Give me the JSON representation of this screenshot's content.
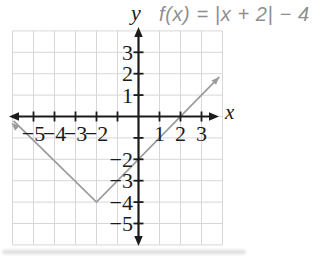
{
  "caption": {
    "y_axis_title": "y",
    "formula": "f(x) = |x + 2| − 4"
  },
  "chart_data": {
    "type": "line",
    "title": "f(x) = |x + 2| − 4",
    "function": "f(x) = |x + 2| − 4",
    "xlabel": "x",
    "ylabel": "y",
    "xlim": [
      -6,
      4
    ],
    "ylim": [
      -6,
      4
    ],
    "grid": true,
    "vertex": [
      -2,
      -4
    ],
    "x_intercepts": [
      -6,
      2
    ],
    "y_intercept": -2,
    "series": [
      {
        "name": "f(x) = |x + 2| − 4",
        "points": [
          [
            -5.95,
            -0.2
          ],
          [
            -2,
            -4
          ],
          [
            3.85,
            1.85
          ]
        ],
        "arrow_both_ends": true
      }
    ],
    "x_tick_marks": [
      -5,
      -4,
      -3,
      -2,
      -1,
      1,
      2,
      3
    ],
    "y_tick_marks": [
      -5,
      -4,
      -3,
      -2,
      -1,
      1,
      2,
      3
    ],
    "x_tick_labels": [
      {
        "v": -5,
        "label": "−5"
      },
      {
        "v": -4,
        "label": "−4"
      },
      {
        "v": -3,
        "label": "−3"
      },
      {
        "v": -2,
        "label": "−2"
      },
      {
        "v": 1,
        "label": "1"
      },
      {
        "v": 2,
        "label": "2"
      },
      {
        "v": 3,
        "label": "3"
      }
    ],
    "y_tick_labels": [
      {
        "v": 3,
        "label": "3"
      },
      {
        "v": 2,
        "label": "2"
      },
      {
        "v": 1,
        "label": "1"
      },
      {
        "v": -2,
        "label": "−2"
      },
      {
        "v": -3,
        "label": "−3"
      },
      {
        "v": -4,
        "label": "−4"
      },
      {
        "v": -5,
        "label": "−5"
      }
    ],
    "colors": {
      "axis": "#1b1b1b",
      "grid": "#d7d7d7",
      "function_line": "#9b9b9b",
      "formula_text": "#8f8f8f",
      "tick_label_text": "#1b1b1b"
    }
  }
}
